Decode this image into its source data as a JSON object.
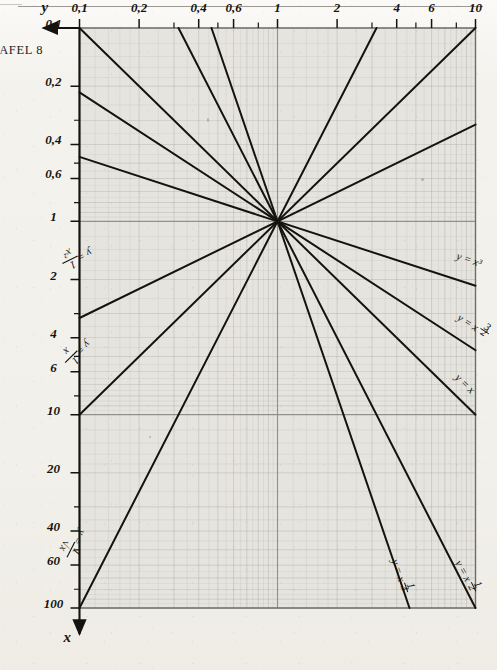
{
  "page": {
    "caption": "TAFEL 8",
    "background_color": "#f4f2ee",
    "ink_color": "#15130f",
    "grid_color": "#8c8a85"
  },
  "chart_data": {
    "type": "line",
    "title": "TAFEL 8",
    "scale": {
      "x": "log",
      "y": "log"
    },
    "xlabel": "x",
    "ylabel": "y",
    "xlim": [
      0.1,
      100
    ],
    "ylim": [
      0.1,
      10
    ],
    "grid": true,
    "legend": "inline-curve-labels",
    "x_ticks": [
      {
        "value": 0.1,
        "label": "0,1"
      },
      {
        "value": 0.2,
        "label": "0,2"
      },
      {
        "value": 0.4,
        "label": "0,4"
      },
      {
        "value": 0.6,
        "label": "0,6"
      },
      {
        "value": 1,
        "label": "1"
      },
      {
        "value": 2,
        "label": "2"
      },
      {
        "value": 4,
        "label": "4"
      },
      {
        "value": 6,
        "label": "6"
      },
      {
        "value": 10,
        "label": "10"
      },
      {
        "value": 20,
        "label": "20"
      },
      {
        "value": 40,
        "label": "40"
      },
      {
        "value": 60,
        "label": "60"
      },
      {
        "value": 100,
        "label": "100"
      }
    ],
    "y_ticks": [
      {
        "value": 10,
        "label": "10"
      },
      {
        "value": 6,
        "label": "6"
      },
      {
        "value": 4,
        "label": "4"
      },
      {
        "value": 2,
        "label": "2"
      },
      {
        "value": 1,
        "label": "1"
      },
      {
        "value": 0.6,
        "label": "0,6"
      },
      {
        "value": 0.4,
        "label": "0,4"
      },
      {
        "value": 0.2,
        "label": "0,2"
      },
      {
        "value": 0.1,
        "label": "0,1"
      }
    ],
    "series": [
      {
        "name": "y = x³",
        "exponent": 3,
        "label": "y = x³",
        "label_num": "",
        "label_den": ""
      },
      {
        "name": "y = x^(3/2)",
        "exponent": 1.5,
        "label": "y = x",
        "label_num": "3",
        "label_den": "2"
      },
      {
        "name": "y = x",
        "exponent": 1,
        "label": "y = x",
        "label_num": "",
        "label_den": ""
      },
      {
        "name": "y = x^(1/2)",
        "exponent": 0.5,
        "label": "y = x",
        "label_num": "1",
        "label_den": "2"
      },
      {
        "name": "y = x^(1/3)",
        "exponent": 0.3333333,
        "label": "y = x",
        "label_num": "1",
        "label_den": "3"
      },
      {
        "name": "y = 1/√x",
        "exponent": -0.5,
        "label": "y = ",
        "label_num": "1",
        "label_den": "√x"
      },
      {
        "name": "y = 1/x",
        "exponent": -1,
        "label": "y = ",
        "label_num": "1",
        "label_den": "x"
      },
      {
        "name": "y = 1/x²",
        "exponent": -2,
        "label": "y = ",
        "label_num": "1",
        "label_den": "x²"
      }
    ],
    "annotations": [
      {
        "id": "curve-label-x3",
        "text": "y = x³"
      },
      {
        "id": "curve-label-x32",
        "text": "y = x^3/2"
      },
      {
        "id": "curve-label-x",
        "text": "y = x"
      },
      {
        "id": "curve-label-sqrtx",
        "text": "y = x^1/2"
      },
      {
        "id": "curve-label-cbrtx",
        "text": "y = x^1/3"
      },
      {
        "id": "curve-label-inv-sqrt",
        "text": "y = 1/√x"
      },
      {
        "id": "curve-label-inv-x",
        "text": "y = 1/x"
      },
      {
        "id": "curve-label-inv-x2",
        "text": "y = 1/x²"
      }
    ],
    "intersection_point": {
      "x": 1,
      "y": 1
    }
  }
}
